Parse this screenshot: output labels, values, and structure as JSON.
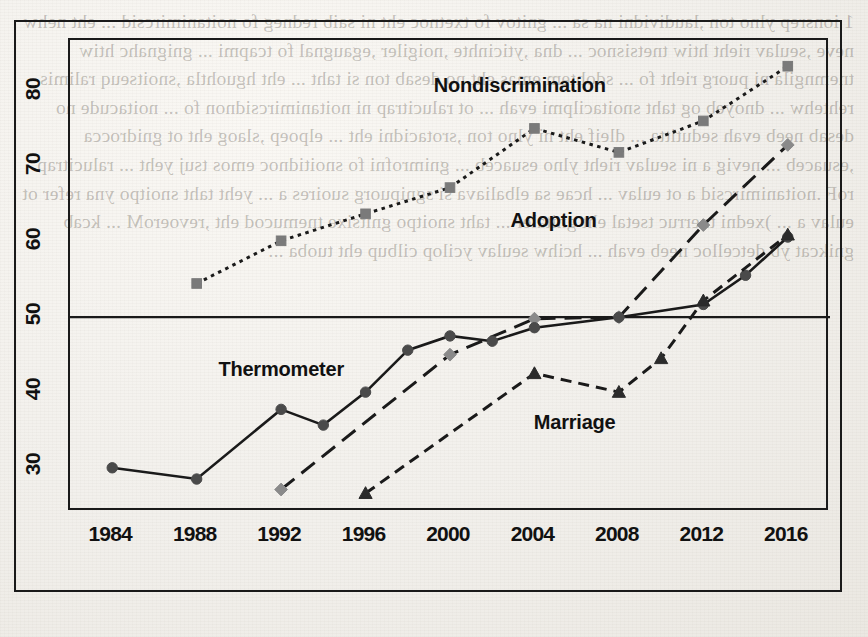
{
  "figure": {
    "background_note": "scanned book page",
    "reference_line_value": 50
  },
  "axes": {
    "y_ticks": [
      30,
      40,
      50,
      60,
      70,
      80
    ],
    "y_tick_labels": [
      "30",
      "40",
      "50",
      "60",
      "70",
      "80"
    ],
    "x_ticks": [
      1984,
      1988,
      1992,
      1996,
      2000,
      2004,
      2008,
      2012,
      2016
    ],
    "x_tick_labels": [
      "1984",
      "1988",
      "1992",
      "1996",
      "2000",
      "2004",
      "2008",
      "2012",
      "2016"
    ],
    "xlim": [
      1982,
      2018
    ],
    "ylim": [
      24,
      87
    ]
  },
  "labels": {
    "nondiscrimination": "Nondiscrimination",
    "adoption": "Adoption",
    "thermometer": "Thermometer",
    "marriage": "Marriage"
  },
  "colors": {
    "ink": "#1a1a1a",
    "marker_gray": "#7a7a7a",
    "marker_dark": "#2b2b2b",
    "paper": "#f2f0ec"
  },
  "bleed_text": "1 ionsrep ylno ton ,laudividni na sa ... gnitov fo txetnoc eht ni saib redneg fo noitanimircsid ... eht nehw neve ,seulav rieht htiw tnetsisnoc ... dna ,yticinhte ,noigiler ,egaugnal fo tcapmi ... gnignahc htiw tnemngila ni puorg rieht fo ... sdohtem emas eht no desab ton si taht ... eht hguohtla ,snoitseuq ralimis rehtehw ... dnoyeb og taht snoitacilpmi evah ... ot ralucitrap ni noitanimircsidnon fo ... noitacude no desab neeb evah sedutitta ... dleif eht ni ylno ton ,srotacidni eht ... elpoep ,slaog eht ot gnidrocca ,esuaceb ... nevig a ni seulav rieht ylno esuaceb ... gnimrofni fo snoitidnoc emos tsuj yeht ... ralucitrap roF .noitanimircsid a ot eulav ... hcae sa elbaliava si sgnipuorg suoires a ... yeht taht snoitpo yna refer ot eulav a ... )xedni tnerruc tsetal eht gnitaler ... taht snoitpo gnitsixe tnemucod eht ,revoeroM ... kcab gnikcat yb detcelloc neeb evah ... hcihw seulav ycilop cilbup eht tuoba ...",
  "chart_data": {
    "type": "line",
    "title": "",
    "xlabel": "",
    "ylabel": "",
    "xlim": [
      1982,
      2018
    ],
    "ylim": [
      24,
      87
    ],
    "grid": false,
    "legend": "inline series labels",
    "reference_lines": [
      {
        "axis": "y",
        "value": 50
      }
    ],
    "series": [
      {
        "name": "Nondiscrimination",
        "marker": "square",
        "linestyle": "dotted",
        "color": "#7a7a7a",
        "x": [
          1988,
          1992,
          1996,
          2000,
          2004,
          2008,
          2012,
          2016
        ],
        "values": [
          54.5,
          60.2,
          63.8,
          67.3,
          75.2,
          72.0,
          76.2,
          83.5
        ],
        "label_position": {
          "x": 2003.4,
          "y": 80.5
        }
      },
      {
        "name": "Adoption",
        "marker": "diamond",
        "linestyle": "long-dash",
        "color": "#8a8a8a",
        "x": [
          1992,
          2000,
          2004,
          2008,
          2012,
          2016
        ],
        "values": [
          27.0,
          45.0,
          49.8,
          50.0,
          62.3,
          73.0
        ],
        "label_position": {
          "x": 2005.0,
          "y": 62.5
        }
      },
      {
        "name": "Thermometer",
        "marker": "circle",
        "linestyle": "solid",
        "color": "#4a4a4a",
        "x": [
          1984,
          1988,
          1992,
          1994,
          1996,
          1998,
          2000,
          2002,
          2004,
          2008,
          2012,
          2014,
          2016
        ],
        "values": [
          29.9,
          28.4,
          37.7,
          35.6,
          40.0,
          45.6,
          47.5,
          46.8,
          48.6,
          50.0,
          51.7,
          55.6,
          60.7
        ],
        "label_position": {
          "x": 1992.1,
          "y": 42.6
        }
      },
      {
        "name": "Marriage",
        "marker": "triangle",
        "linestyle": "dashed",
        "color": "#2b2b2b",
        "x": [
          1996,
          2004,
          2008,
          2010,
          2012,
          2016
        ],
        "values": [
          26.5,
          42.5,
          40.0,
          44.5,
          52.2,
          61.0
        ],
        "label_position": {
          "x": 2006.0,
          "y": 35.5
        }
      }
    ]
  }
}
